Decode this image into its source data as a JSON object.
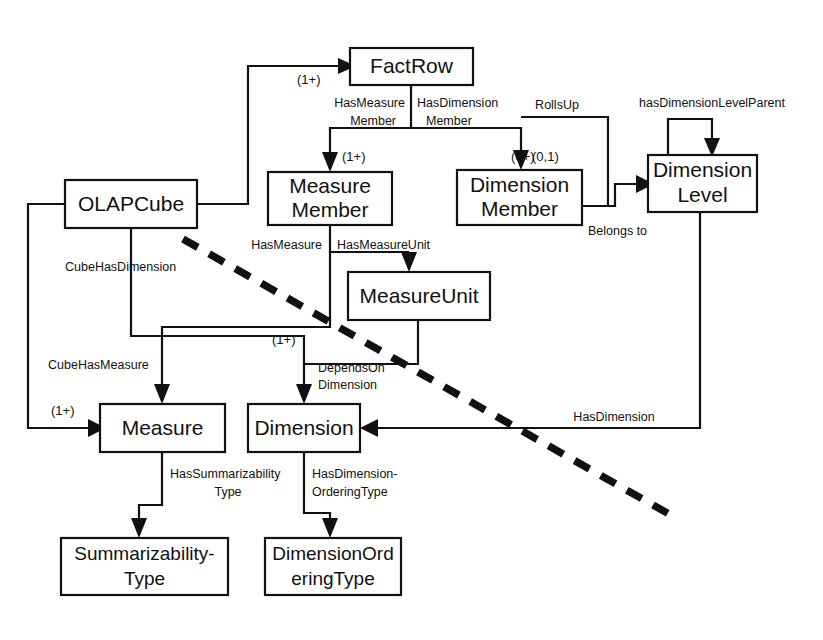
{
  "diagram": {
    "colors": {
      "stroke": "#111111",
      "background": "#ffffff"
    },
    "entities": [
      {
        "id": "factrow",
        "label": "FactRow",
        "line2": ""
      },
      {
        "id": "olapcube",
        "label": "OLAPCube",
        "line2": ""
      },
      {
        "id": "measuremember",
        "label": "Measure",
        "line2": "Member"
      },
      {
        "id": "dimensionmember",
        "label": "Dimension",
        "line2": "Member"
      },
      {
        "id": "dimensionlevel",
        "label": "Dimension",
        "line2": "Level"
      },
      {
        "id": "measureunit",
        "label": "MeasureUnit",
        "line2": ""
      },
      {
        "id": "measure",
        "label": "Measure",
        "line2": ""
      },
      {
        "id": "dimension",
        "label": "Dimension",
        "line2": ""
      },
      {
        "id": "summtype",
        "label": "Summarizability-",
        "line2": "Type"
      },
      {
        "id": "dimordtype",
        "label": "DimensionOrd",
        "line2": "eringType"
      }
    ],
    "relationships": [
      {
        "id": "has-measure-member",
        "label": "HasMeasure",
        "label2": "Member"
      },
      {
        "id": "has-dimension-member",
        "label": "HasDimension",
        "label2": "Member"
      },
      {
        "id": "rolls-up",
        "label": "RollsUp",
        "label2": ""
      },
      {
        "id": "has-dimension-level-parent",
        "label": "hasDimensionLevelParent",
        "label2": ""
      },
      {
        "id": "belongs-to",
        "label": "Belongs to",
        "label2": ""
      },
      {
        "id": "cube-has-dimension",
        "label": "CubeHasDimension",
        "label2": ""
      },
      {
        "id": "cube-has-measure",
        "label": "CubeHasMeasure",
        "label2": ""
      },
      {
        "id": "has-measure",
        "label": "HasMeasure",
        "label2": ""
      },
      {
        "id": "has-measure-unit",
        "label": "HasMeasureUnit",
        "label2": ""
      },
      {
        "id": "depends-on-dimension",
        "label": "DependsOn",
        "label2": "Dimension"
      },
      {
        "id": "has-summarizability-type",
        "label": "HasSummarizability",
        "label2": "Type"
      },
      {
        "id": "has-dimension-ordering-type",
        "label": "HasDimension-",
        "label2": "OrderingType"
      },
      {
        "id": "has-dimension",
        "label": "HasDimension",
        "label2": ""
      }
    ],
    "cardinalities": [
      {
        "id": "card-factrow",
        "value": "(1+)"
      },
      {
        "id": "card-measuremember",
        "value": "(1+)"
      },
      {
        "id": "card-dimensionmember",
        "value": "(0+)"
      },
      {
        "id": "card-dimensionmember-2",
        "value": "(0,1)"
      },
      {
        "id": "card-measure",
        "value": "(1+)"
      },
      {
        "id": "card-dimension",
        "value": "(1+)"
      }
    ]
  }
}
